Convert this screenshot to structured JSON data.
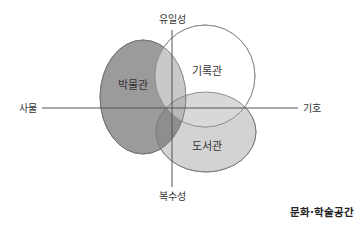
{
  "diagram": {
    "axes": {
      "top": "유일성",
      "bottom": "복수성",
      "left": "사물",
      "right": "기호"
    },
    "sets": [
      {
        "id": "museum",
        "label": "박물관",
        "fill": "#9b9b9b"
      },
      {
        "id": "archive",
        "label": "기록관",
        "fill": "#ffffff"
      },
      {
        "id": "library",
        "label": "도서관",
        "fill": "#d3d3d3"
      }
    ],
    "caption": "문화·학술공간",
    "colors": {
      "axis": "#555555",
      "outline": "#777777",
      "overlap_museum_archive": "#c9c9c9",
      "overlap_all": "#8e8e8e"
    }
  }
}
